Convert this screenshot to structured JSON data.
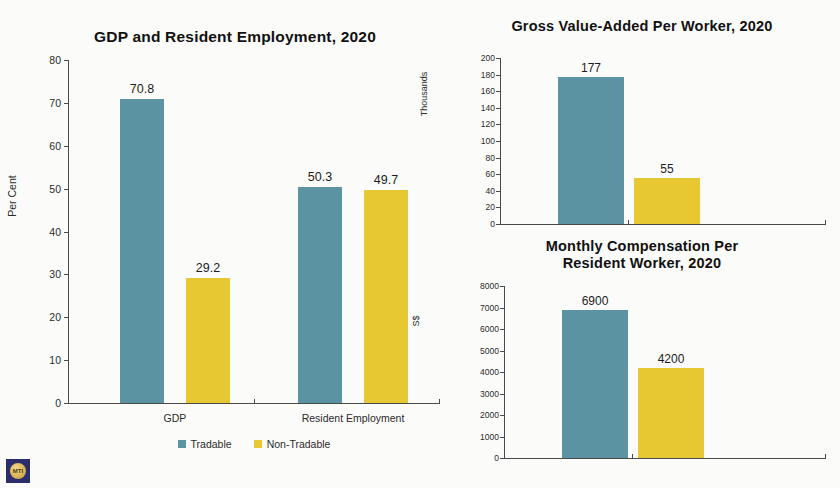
{
  "colors": {
    "tradable": "#5b93a3",
    "non_tradable": "#e8c832",
    "axis": "#4a4a4a",
    "background": "#fbfbfa",
    "logo_bg": "#2b2e6b",
    "logo_emblem": "#d9b455"
  },
  "legend": {
    "tradable_label": "Tradable",
    "non_tradable_label": "Non-Tradable"
  },
  "logo": {
    "text": "MTI"
  },
  "chart_data": [
    {
      "id": "gdp",
      "type": "bar",
      "title": "GDP and Resident Employment, 2020",
      "xlabel": "",
      "ylabel": "Per Cent",
      "ylim": [
        0,
        80
      ],
      "yticks": [
        0,
        10,
        20,
        30,
        40,
        50,
        60,
        70,
        80
      ],
      "grid": false,
      "legend_position": "bottom",
      "categories": [
        "GDP",
        "Resident Employment"
      ],
      "series": [
        {
          "name": "Tradable",
          "values": [
            70.8,
            50.3
          ],
          "labels": [
            "70.8",
            "50.3"
          ]
        },
        {
          "name": "Non-Tradable",
          "values": [
            29.2,
            49.7
          ],
          "labels": [
            "29.2",
            "49.7"
          ]
        }
      ]
    },
    {
      "id": "gva",
      "type": "bar",
      "title": "Gross Value-Added Per Worker, 2020",
      "xlabel": "",
      "ylabel": "Thousands",
      "ylim": [
        0,
        200
      ],
      "yticks": [
        0,
        20,
        40,
        60,
        80,
        100,
        120,
        140,
        160,
        180,
        200
      ],
      "grid": false,
      "legend_position": "none",
      "categories": [
        "Tradable",
        "Non-Tradable"
      ],
      "series": [
        {
          "name": "Value",
          "values": [
            177,
            55
          ],
          "labels": [
            "177",
            "55"
          ]
        }
      ]
    },
    {
      "id": "compensation",
      "type": "bar",
      "title_line1": "Monthly Compensation Per",
      "title_line2": "Resident Worker, 2020",
      "title": "Monthly Compensation Per Resident Worker, 2020",
      "xlabel": "",
      "ylabel": "S$",
      "ylim": [
        0,
        8000
      ],
      "yticks": [
        0,
        1000,
        2000,
        3000,
        4000,
        5000,
        6000,
        7000,
        8000
      ],
      "grid": false,
      "legend_position": "none",
      "categories": [
        "Tradable",
        "Non-Tradable"
      ],
      "series": [
        {
          "name": "Value",
          "values": [
            6900,
            4200
          ],
          "labels": [
            "6900",
            "4200"
          ]
        }
      ]
    }
  ]
}
